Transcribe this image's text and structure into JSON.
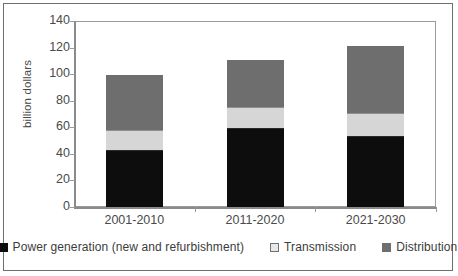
{
  "chart_data": {
    "type": "bar",
    "subtype": "stacked-bar",
    "title": "",
    "xlabel": "",
    "ylabel": "billion dollars",
    "ylim": [
      0,
      140
    ],
    "ytick_step": 20,
    "yticks": [
      "140",
      "120",
      "100",
      "80",
      "60",
      "40",
      "20",
      "0"
    ],
    "grid": false,
    "legend_position": "bottom",
    "categories": [
      "2001-2010",
      "2011-2020",
      "2021-2030"
    ],
    "series": [
      {
        "name": "Power generation (new and refurbishment)",
        "color": "#0d0d0d",
        "values": [
          42,
          59,
          53
        ]
      },
      {
        "name": "Transmission",
        "color": "#d6d6d6",
        "values": [
          16,
          16,
          18
        ]
      },
      {
        "name": "Distribution",
        "color": "#6e6e6e",
        "values": [
          41,
          36,
          50
        ]
      }
    ],
    "totals": [
      99,
      111,
      121
    ]
  },
  "axis": {
    "y_title": "billion dollars"
  },
  "legend": {
    "items": [
      {
        "label": "Power generation (new and refurbishment)",
        "swatch": "legend-swatch-power-generation"
      },
      {
        "label": "Transmission",
        "swatch": "legend-swatch-transmission"
      },
      {
        "label": "Distribution",
        "swatch": "legend-swatch-distribution"
      }
    ]
  }
}
